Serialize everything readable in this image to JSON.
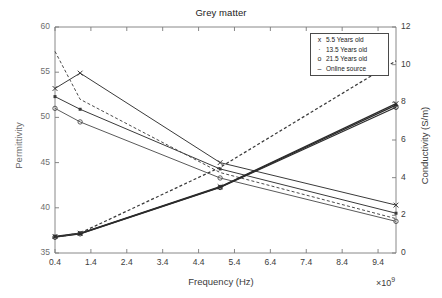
{
  "chart_data": {
    "type": "line",
    "title": "Grey matter",
    "xlabel": "Frequency (Hz)",
    "x_multiplier": "×10",
    "x_multiplier_exp": "9",
    "ylabel_left": "Permittivity",
    "ylabel_right": "Conductivity (S/m)",
    "xlim": [
      0.4,
      9.9
    ],
    "ylim_left": [
      35,
      60
    ],
    "ylim_right": [
      0,
      12
    ],
    "xticks": [
      0.4,
      1.4,
      2.4,
      3.4,
      4.4,
      5.4,
      6.4,
      7.4,
      8.4,
      9.4
    ],
    "xticklabels": [
      "0.4",
      "1.4",
      "2.4",
      "3.4",
      "4.4",
      "5.4",
      "6.4",
      "7.4",
      "8.4",
      "9.4"
    ],
    "yticks_left": [
      35,
      40,
      45,
      50,
      55,
      60
    ],
    "yticklabels_left": [
      "35",
      "40",
      "45",
      "50",
      "55",
      "60"
    ],
    "yticks_right": [
      0,
      2,
      4,
      6,
      8,
      10,
      12
    ],
    "yticklabels_right": [
      "0",
      "2",
      "4",
      "6",
      "8",
      "10",
      "12"
    ],
    "grid": false,
    "legend_position": "upper right",
    "x": [
      0.4,
      1.1,
      5.0,
      9.9
    ],
    "series": [
      {
        "name": "5.5 Years old",
        "marker": "x",
        "linestyle": "solid",
        "color": "#3a3a3a",
        "axis": "left",
        "quantity": "permittivity",
        "values": [
          53.2,
          54.9,
          45.0,
          40.3
        ]
      },
      {
        "name": "13.5 Years old",
        "marker": "·",
        "linestyle": "solid",
        "color": "#3a3a3a",
        "axis": "left",
        "quantity": "permittivity",
        "values": [
          52.3,
          50.9,
          44.3,
          39.4
        ]
      },
      {
        "name": "21.5 Years old",
        "marker": "o",
        "linestyle": "solid",
        "color": "#5a5a5a",
        "axis": "left",
        "quantity": "permittivity",
        "values": [
          51.0,
          49.5,
          43.3,
          38.5
        ]
      },
      {
        "name": "Online source",
        "marker": "–",
        "linestyle": "dashed",
        "color": "#4a4a4a",
        "axis": "left",
        "quantity": "permittivity",
        "values": [
          57.3,
          52.0,
          43.9,
          38.8
        ]
      },
      {
        "name": "5.5 Years old",
        "marker": "x",
        "linestyle": "solid",
        "color": "#2b2b2b",
        "axis": "right",
        "quantity": "conductivity",
        "values": [
          0.88,
          1.05,
          3.52,
          7.93
        ]
      },
      {
        "name": "13.5 Years old",
        "marker": "·",
        "linestyle": "solid",
        "color": "#2b2b2b",
        "axis": "right",
        "quantity": "conductivity",
        "values": [
          0.86,
          1.03,
          3.5,
          7.85
        ]
      },
      {
        "name": "21.5 Years old",
        "marker": "o",
        "linestyle": "solid",
        "color": "#2b2b2b",
        "axis": "right",
        "quantity": "conductivity",
        "values": [
          0.84,
          1.02,
          3.48,
          7.74
        ]
      },
      {
        "name": "Online source",
        "marker": "–",
        "linestyle": "dashed",
        "color": "#3a3a3a",
        "axis": "right",
        "quantity": "conductivity",
        "values": [
          0.83,
          1.06,
          4.55,
          10.2
        ]
      }
    ],
    "legend": [
      {
        "marker": "x",
        "label": "5.5 Years old"
      },
      {
        "marker": "·",
        "label": "13.5 Years old"
      },
      {
        "marker": "o",
        "label": "21.5 Years old"
      },
      {
        "marker": "–",
        "label": "Online source"
      }
    ]
  },
  "colors": {
    "axis": "#7a7a7a",
    "text_dark": "#1a1a1a",
    "text_gray": "#6e6e6e",
    "background": "#ffffff"
  }
}
